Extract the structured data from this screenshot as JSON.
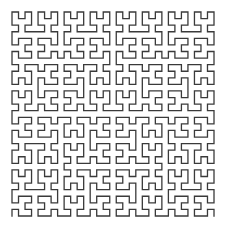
{
  "figure": {
    "title": "Hilbert curve",
    "curve_type": "hilbert",
    "order": 5,
    "grid_size": 32,
    "orientation": "open-bottom",
    "bounds": {
      "x0": 12,
      "y0": 12,
      "x1": 214,
      "y1": 216
    },
    "stroke_color": "#3a3a3a",
    "stroke_width": 1.3,
    "background": "#ffffff"
  }
}
